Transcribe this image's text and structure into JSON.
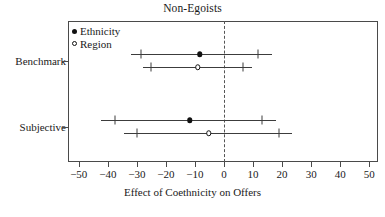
{
  "chart_data": {
    "type": "scatter",
    "title": "Non-Egoists",
    "xlabel": "Effect of Coethnicity on Offers",
    "ylabel": "",
    "xlim": [
      -55,
      55
    ],
    "xticks": [
      -50,
      -40,
      -30,
      -20,
      -10,
      0,
      10,
      20,
      30,
      40,
      50
    ],
    "xticklabels": [
      "−50",
      "−40",
      "−30",
      "−20",
      "−10",
      "0",
      "10",
      "20",
      "30",
      "40",
      "50"
    ],
    "categories": [
      "Benchmark",
      "Subjective"
    ],
    "grid": false,
    "reference_line": {
      "x": 0,
      "style": "dashed"
    },
    "legend": {
      "position": "top-left-inside",
      "entries": [
        {
          "label": "Ethnicity",
          "marker": "filled-circle"
        },
        {
          "label": "Region",
          "marker": "open-circle"
        }
      ]
    },
    "series": [
      {
        "name": "Ethnicity",
        "marker": "filled-circle",
        "points": [
          {
            "category": "Benchmark",
            "estimate": -8.3,
            "inner_low": -28.7,
            "inner_high": 11.7,
            "outer_low": -32.0,
            "outer_high": 16.5
          },
          {
            "category": "Subjective",
            "estimate": -11.8,
            "inner_low": -37.5,
            "inner_high": 13.2,
            "outer_low": -42.5,
            "outer_high": 17.8
          }
        ]
      },
      {
        "name": "Region",
        "marker": "open-circle",
        "points": [
          {
            "category": "Benchmark",
            "estimate": -9.0,
            "inner_low": -25.0,
            "inner_high": 6.5,
            "outer_low": -28.0,
            "outer_high": 9.8
          },
          {
            "category": "Subjective",
            "estimate": -5.2,
            "inner_low": -30.0,
            "inner_high": 19.0,
            "outer_low": -34.5,
            "outer_high": 23.3
          }
        ]
      }
    ]
  },
  "axis": {
    "y_labels": [
      {
        "text": "Benchmark",
        "value": 0
      },
      {
        "text": "Subjective",
        "value": 1
      }
    ]
  }
}
